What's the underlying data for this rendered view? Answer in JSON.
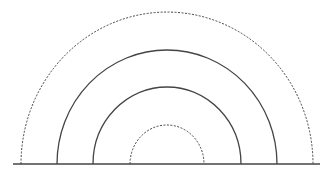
{
  "diagram": {
    "center": {
      "x": 167,
      "y": 164
    },
    "stroke_color": "#444444",
    "baseline": {
      "x1": 13,
      "x2": 320,
      "y": 164
    },
    "arcs": [
      {
        "name": "outer-dashed-arc",
        "rx": 146,
        "ry": 152,
        "style": "dashed"
      },
      {
        "name": "outer-solid-arc",
        "rx": 110,
        "ry": 114,
        "style": "solid"
      },
      {
        "name": "inner-solid-arc",
        "rx": 74,
        "ry": 77,
        "style": "solid"
      },
      {
        "name": "inner-dashed-arc",
        "rx": 37,
        "ry": 39,
        "style": "dashed"
      }
    ]
  }
}
